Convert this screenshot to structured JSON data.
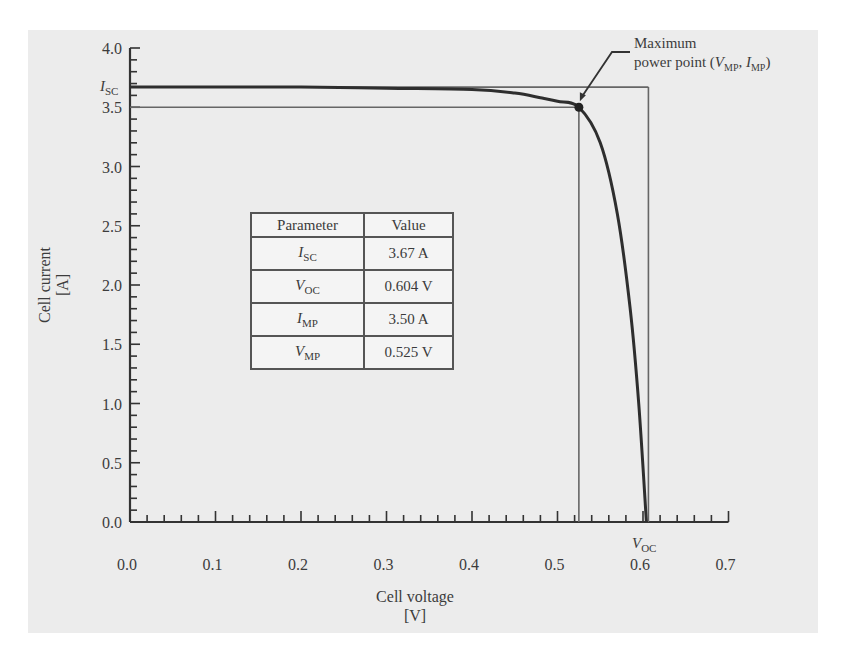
{
  "chart_data": {
    "type": "line",
    "title": "",
    "xlabel": "Cell voltage",
    "xunit": "[V]",
    "ylabel": "Cell current",
    "yunit": "[A]",
    "xlim": [
      0.0,
      0.7
    ],
    "ylim": [
      0.0,
      4.0
    ],
    "x_ticks": [
      "0.0",
      "0.1",
      "0.2",
      "0.3",
      "0.4",
      "0.5",
      "0.6",
      "0.7"
    ],
    "y_ticks": [
      "0.0",
      "0.5",
      "1.0",
      "1.5",
      "2.0",
      "2.5",
      "3.0",
      "3.5",
      "4.0"
    ],
    "grid": false,
    "series": [
      {
        "name": "I-V curve",
        "x": [
          0.0,
          0.1,
          0.2,
          0.3,
          0.4,
          0.45,
          0.48,
          0.5,
          0.525,
          0.55,
          0.57,
          0.585,
          0.595,
          0.604
        ],
        "values": [
          3.67,
          3.67,
          3.67,
          3.66,
          3.65,
          3.62,
          3.58,
          3.55,
          3.5,
          3.2,
          2.6,
          1.8,
          1.0,
          0.0
        ]
      }
    ],
    "reference_lines": {
      "Isc_horizontal": 3.67,
      "Imp_horizontal": 3.5,
      "Vmp_vertical": 0.525,
      "Voc_vertical": 0.604
    },
    "annotations": [
      {
        "text_line1": "Maximum",
        "text_line2": "power point (",
        "V": "V",
        "V_sub": "MP",
        "sep": ", ",
        "I": "I",
        "I_sub": "MP",
        "close": ")",
        "x": 0.525,
        "y": 3.5
      },
      {
        "text": "Voc",
        "symbol": "V",
        "sub": "OC",
        "x": 0.604,
        "y": 0.0
      },
      {
        "text": "Isc",
        "symbol": "I",
        "sub": "SC",
        "x": 0.0,
        "y": 3.67
      }
    ],
    "table": {
      "headers": [
        "Parameter",
        "Value"
      ],
      "rows": [
        {
          "symbol": "I",
          "sub": "SC",
          "value": "3.67 A"
        },
        {
          "symbol": "V",
          "sub": "OC",
          "value": "0.604 V"
        },
        {
          "symbol": "I",
          "sub": "MP",
          "value": "3.50 A"
        },
        {
          "symbol": "V",
          "sub": "MP",
          "value": "0.525 V"
        }
      ]
    }
  }
}
